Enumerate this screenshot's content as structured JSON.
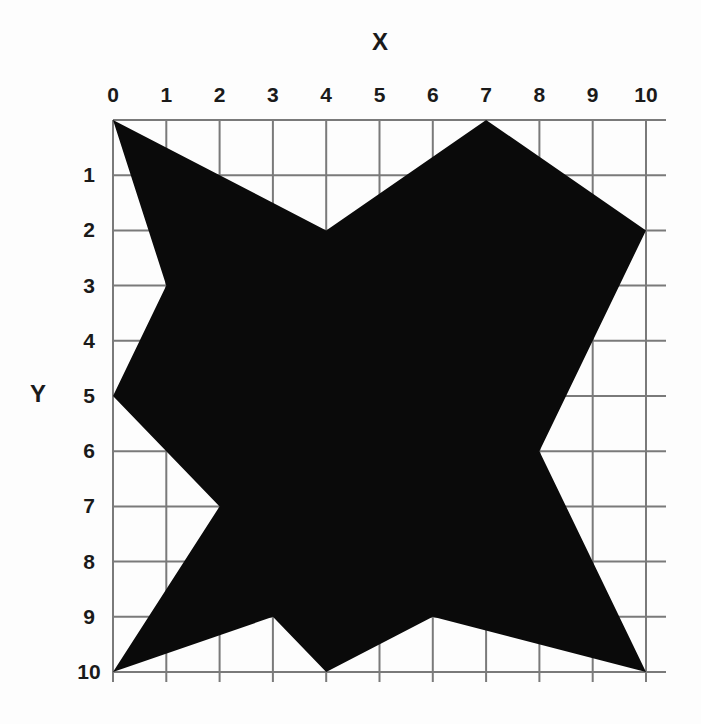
{
  "axis": {
    "x_title": "X",
    "y_title": "Y",
    "x_ticks": [
      "0",
      "1",
      "2",
      "3",
      "4",
      "5",
      "6",
      "7",
      "8",
      "9",
      "10"
    ],
    "y_ticks": [
      "0",
      "1",
      "2",
      "3",
      "4",
      "5",
      "6",
      "7",
      "8",
      "9",
      "10"
    ]
  },
  "colors": {
    "grid": "#7a7a7a",
    "shape": "#0a0a0a",
    "background": "#fdfdfd"
  },
  "shape": {
    "name": "star-polygon",
    "vertices": [
      [
        0,
        0
      ],
      [
        4,
        2
      ],
      [
        7,
        0
      ],
      [
        10,
        2
      ],
      [
        8,
        6
      ],
      [
        10,
        10
      ],
      [
        6,
        9
      ],
      [
        4,
        10
      ],
      [
        3,
        9
      ],
      [
        0,
        10
      ],
      [
        2,
        7
      ],
      [
        0,
        5
      ],
      [
        1,
        3
      ]
    ]
  }
}
